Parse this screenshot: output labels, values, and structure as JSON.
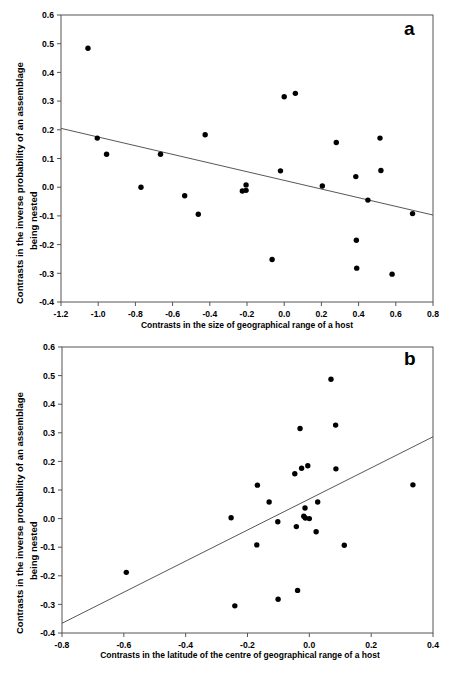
{
  "figure": {
    "background": "#ffffff",
    "marker_color": "#000000",
    "line_color": "#444444",
    "axis_color": "#555555"
  },
  "chart_data": [
    {
      "type": "scatter",
      "panel_label": "a",
      "title": "",
      "xlabel": "Contrasts in the size of geographical range of a host",
      "ylabel_line1": "Contrasts in the inverse probability of an assemblage",
      "ylabel_line2": "being nested",
      "xlim": [
        -1.2,
        0.8
      ],
      "ylim": [
        -0.4,
        0.6
      ],
      "xticks": [
        -1.2,
        -1.0,
        -0.8,
        -0.6,
        -0.4,
        -0.2,
        0.0,
        0.2,
        0.4,
        0.6,
        0.8
      ],
      "xticklabels": [
        "-1.2",
        "-1.0",
        "-0.8",
        "-0.6",
        "-0.4",
        "-0.2",
        "0.0",
        "0.2",
        "0.4",
        "0.6",
        "0.8"
      ],
      "yticks": [
        -0.4,
        -0.3,
        -0.2,
        -0.1,
        0.0,
        0.1,
        0.2,
        0.3,
        0.4,
        0.5,
        0.6
      ],
      "yticklabels": [
        "-0.4",
        "-0.3",
        "-0.2",
        "-0.1",
        "0.0",
        "0.1",
        "0.2",
        "0.3",
        "0.4",
        "0.5",
        "0.6"
      ],
      "grid": false,
      "legend": false,
      "points": [
        [
          -1.055,
          0.484
        ],
        [
          -1.005,
          0.171
        ],
        [
          -0.955,
          0.115
        ],
        [
          -0.77,
          0.0
        ],
        [
          -0.665,
          0.115
        ],
        [
          -0.535,
          -0.03
        ],
        [
          -0.462,
          -0.094
        ],
        [
          -0.425,
          0.183
        ],
        [
          -0.205,
          0.008
        ],
        [
          -0.205,
          -0.011
        ],
        [
          -0.225,
          -0.013
        ],
        [
          -0.065,
          -0.252
        ],
        [
          -0.02,
          0.057
        ],
        [
          0.0,
          0.315
        ],
        [
          0.06,
          0.327
        ],
        [
          0.205,
          0.004
        ],
        [
          0.28,
          0.156
        ],
        [
          0.385,
          0.037
        ],
        [
          0.388,
          -0.185
        ],
        [
          0.39,
          -0.282
        ],
        [
          0.45,
          -0.045
        ],
        [
          0.515,
          0.171
        ],
        [
          0.52,
          0.058
        ],
        [
          0.58,
          -0.303
        ],
        [
          0.69,
          -0.092
        ]
      ],
      "fit_line": {
        "x1": -1.2,
        "y1": 0.205,
        "x2": 0.8,
        "y2": -0.097
      }
    },
    {
      "type": "scatter",
      "panel_label": "b",
      "title": "",
      "xlabel": "Contrasts in the latitude of the centre of geographical range of a host",
      "ylabel_line1": "Contrasts in the inverse probability of an assemblage",
      "ylabel_line2": "being nested",
      "xlim": [
        -0.8,
        0.4
      ],
      "ylim": [
        -0.4,
        0.6
      ],
      "xticks": [
        -0.8,
        -0.6,
        -0.4,
        -0.2,
        0.0,
        0.2,
        0.4
      ],
      "xticklabels": [
        "-0.8",
        "-0.6",
        "-0.4",
        "-0.2",
        "0.0",
        "0.2",
        "0.4"
      ],
      "yticks": [
        -0.4,
        -0.3,
        -0.2,
        -0.1,
        0.0,
        0.1,
        0.2,
        0.3,
        0.4,
        0.5,
        0.6
      ],
      "yticklabels": [
        "-0.4",
        "-0.3",
        "-0.2",
        "-0.1",
        "0.0",
        "0.1",
        "0.2",
        "0.3",
        "0.4",
        "0.5",
        "0.6"
      ],
      "grid": false,
      "legend": false,
      "points": [
        [
          -0.592,
          -0.188
        ],
        [
          -0.253,
          0.003
        ],
        [
          -0.241,
          -0.305
        ],
        [
          -0.168,
          0.117
        ],
        [
          -0.17,
          -0.092
        ],
        [
          -0.13,
          0.058
        ],
        [
          -0.102,
          -0.011
        ],
        [
          -0.101,
          -0.282
        ],
        [
          -0.047,
          0.157
        ],
        [
          -0.042,
          -0.028
        ],
        [
          -0.038,
          -0.251
        ],
        [
          -0.03,
          0.315
        ],
        [
          -0.025,
          0.176
        ],
        [
          -0.018,
          0.008
        ],
        [
          -0.013,
          0.002
        ],
        [
          -0.014,
          0.037
        ],
        [
          -0.005,
          0.185
        ],
        [
          0.0,
          0.0
        ],
        [
          0.022,
          -0.046
        ],
        [
          0.027,
          0.058
        ],
        [
          0.07,
          0.487
        ],
        [
          0.085,
          0.327
        ],
        [
          0.086,
          0.174
        ],
        [
          0.113,
          -0.093
        ],
        [
          0.335,
          0.118
        ]
      ],
      "fit_line": {
        "x1": -0.8,
        "y1": -0.366,
        "x2": 0.4,
        "y2": 0.286
      }
    }
  ]
}
